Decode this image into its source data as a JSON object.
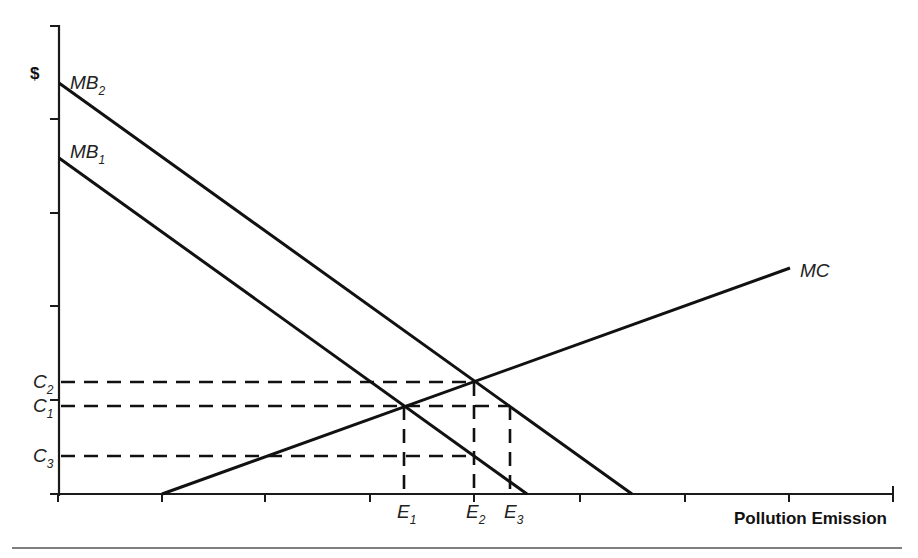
{
  "diagram": {
    "y_axis_label": "$",
    "x_axis_label": "Pollution Emission",
    "curves": [
      {
        "name": "MB2",
        "base": "MB",
        "sub": "2",
        "from": [
          59,
          83
        ],
        "to": [
          632,
          494
        ]
      },
      {
        "name": "MB1",
        "base": "MB",
        "sub": "1",
        "from": [
          59,
          158
        ],
        "to": [
          527,
          494
        ]
      },
      {
        "name": "MC",
        "base": "MC",
        "sub": "",
        "from": [
          162,
          494
        ],
        "to": [
          790,
          268
        ]
      }
    ],
    "y_levels": [
      {
        "name": "C2",
        "base": "C",
        "sub": "2",
        "y": 382,
        "x_end": 474
      },
      {
        "name": "C1",
        "base": "C",
        "sub": "1",
        "y": 406,
        "x_end": 510
      },
      {
        "name": "C3",
        "base": "C",
        "sub": "3",
        "y": 456,
        "x_end": 474
      }
    ],
    "x_levels": [
      {
        "name": "E1",
        "base": "E",
        "sub": "1",
        "x": 404,
        "y_top": 406
      },
      {
        "name": "E2",
        "base": "E",
        "sub": "2",
        "x": 474,
        "y_top": 382
      },
      {
        "name": "E3",
        "base": "E",
        "sub": "3",
        "x": 510,
        "y_top": 406
      }
    ],
    "equilibria": [
      {
        "label": "MB1 = MC",
        "point": [
          404,
          406
        ],
        "emission": "E1",
        "cost": "C1"
      },
      {
        "label": "MB2 = MC",
        "point": [
          474,
          382
        ],
        "emission": "E2",
        "cost": "C2"
      }
    ]
  },
  "labels": {
    "mb2_base": "MB",
    "mb2_sub": "2",
    "mb1_base": "MB",
    "mb1_sub": "1",
    "mc": "MC",
    "c2_base": "C",
    "c2_sub": "2",
    "c1_base": "C",
    "c1_sub": "1",
    "c3_base": "C",
    "c3_sub": "3",
    "e1_base": "E",
    "e1_sub": "1",
    "e2_base": "E",
    "e2_sub": "2",
    "e3_base": "E",
    "e3_sub": "3",
    "dollar": "$",
    "x_axis": "Pollution Emission"
  }
}
